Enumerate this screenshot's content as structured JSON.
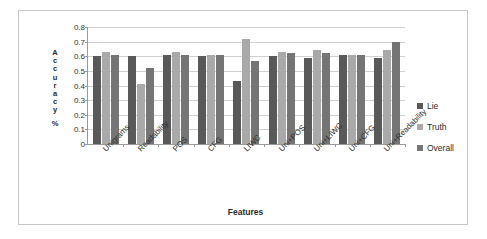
{
  "chart_data": {
    "type": "bar",
    "title": "",
    "xlabel": "Features",
    "ylabel": "Accuracy %",
    "ylim": [
      0,
      0.8
    ],
    "ytick_labels": [
      "0.8",
      "0.7",
      "0.6",
      "0.5",
      "0.4",
      "0.3",
      "0.2",
      "0.1",
      "0"
    ],
    "ytick_values": [
      0.8,
      0.7,
      0.6,
      0.5,
      0.4,
      0.3,
      0.2,
      0.1,
      0
    ],
    "grid": true,
    "legend_position": "right",
    "categories": [
      "Unigrams",
      "Readability",
      "POS",
      "CFG",
      "LIWC",
      "Uni+POS",
      "Uni+LIWC",
      "Uni+CFG",
      "Uni+Readability"
    ],
    "series": [
      {
        "name": "Lie",
        "color": "#595959",
        "values": [
          0.6,
          0.6,
          0.61,
          0.6,
          0.43,
          0.6,
          0.59,
          0.61,
          0.59
        ]
      },
      {
        "name": "Truth",
        "color": "#a9a9a9",
        "values": [
          0.63,
          0.41,
          0.63,
          0.61,
          0.72,
          0.63,
          0.64,
          0.61,
          0.64
        ]
      },
      {
        "name": "Overall",
        "color": "#757575",
        "values": [
          0.61,
          0.52,
          0.61,
          0.61,
          0.57,
          0.62,
          0.62,
          0.61,
          0.7
        ]
      }
    ]
  },
  "y_axis_title_letters": [
    "A",
    "c",
    "c",
    "u",
    "r",
    "a",
    "c",
    "y",
    "%"
  ]
}
